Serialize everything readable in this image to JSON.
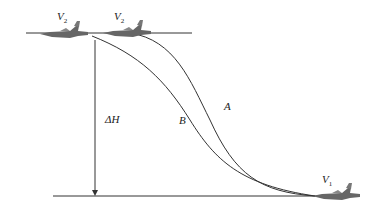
{
  "diagram": {
    "labels": {
      "v2_left": "V",
      "v2_left_sub": "2",
      "v2_right": "V",
      "v2_right_sub": "2",
      "v1": "V",
      "v1_sub": "1",
      "delta_h": "ΔH",
      "curve_a": "A",
      "curve_b": "B"
    },
    "colors": {
      "line": "#333333",
      "aircraft": "#555555"
    }
  }
}
